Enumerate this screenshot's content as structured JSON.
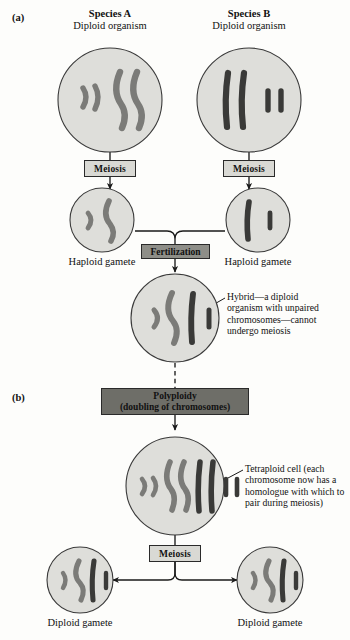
{
  "figure": {
    "type": "allopolyploidy-speciation-diagram",
    "panels": [
      {
        "id": "a",
        "label": "(a)"
      },
      {
        "id": "b",
        "label": "(b)"
      }
    ],
    "colors": {
      "cell_fill": "#dededa",
      "cell_stroke": "#3a3a3a",
      "chromosome_species_a": "#7b7b78",
      "chromosome_species_b": "#3a3a38",
      "meiosis_box": "#d9d9d4",
      "fertilization_box": "#8e8e88",
      "polyploidy_box": "#6e6e68",
      "background": "#fdfdfb"
    }
  },
  "headers": {
    "species_a": {
      "name": "Species A",
      "subtitle": "Diploid organism"
    },
    "species_b": {
      "name": "Species B",
      "subtitle": "Diploid organism"
    }
  },
  "process_boxes": {
    "meiosis_left": "Meiosis",
    "meiosis_right": "Meiosis",
    "fertilization": "Fertilization",
    "polyploidy_line1": "Polyploidy",
    "polyploidy_line2": "(doubling of chromosomes)",
    "meiosis_bottom": "Meiosis"
  },
  "captions": {
    "haploid_gamete_left": "Haploid gamete",
    "haploid_gamete_right": "Haploid gamete",
    "diploid_gamete_left": "Diploid gamete",
    "diploid_gamete_right": "Diploid gamete"
  },
  "annotations": {
    "hybrid": "Hybrid—a diploid organism with unpaired chromosomes—cannot undergo meiosis",
    "tetraploid": "Tetraploid cell (each chromosome now has a homologue with which to pair during meiosis)"
  },
  "cells": [
    {
      "id": "species-a-parent",
      "caption": "Species A diploid organism",
      "chromosome_count": 4,
      "chromosomes": [
        {
          "type": "short-curved",
          "species": "A"
        },
        {
          "type": "short-curved",
          "species": "A"
        },
        {
          "type": "long-curved",
          "species": "A"
        },
        {
          "type": "long-curved",
          "species": "A"
        }
      ]
    },
    {
      "id": "species-b-parent",
      "caption": "Species B diploid organism",
      "chromosome_count": 4,
      "chromosomes": [
        {
          "type": "long-straight",
          "species": "B"
        },
        {
          "type": "long-straight",
          "species": "B"
        },
        {
          "type": "short-straight",
          "species": "B"
        },
        {
          "type": "short-straight",
          "species": "B"
        }
      ]
    },
    {
      "id": "haploid-gamete-a",
      "caption": "Haploid gamete",
      "chromosome_count": 2,
      "chromosomes": [
        {
          "type": "short-curved",
          "species": "A"
        },
        {
          "type": "long-curved",
          "species": "A"
        }
      ]
    },
    {
      "id": "haploid-gamete-b",
      "caption": "Haploid gamete",
      "chromosome_count": 2,
      "chromosomes": [
        {
          "type": "long-straight",
          "species": "B"
        },
        {
          "type": "short-straight",
          "species": "B"
        }
      ]
    },
    {
      "id": "hybrid-cell",
      "caption": "Hybrid diploid organism",
      "chromosome_count": 4,
      "chromosomes": [
        {
          "type": "short-curved",
          "species": "A"
        },
        {
          "type": "long-curved",
          "species": "A"
        },
        {
          "type": "long-straight",
          "species": "B"
        },
        {
          "type": "short-straight",
          "species": "B"
        }
      ]
    },
    {
      "id": "tetraploid-cell",
      "caption": "Tetraploid cell",
      "chromosome_count": 8,
      "chromosomes": [
        {
          "type": "short-curved",
          "species": "A"
        },
        {
          "type": "short-curved",
          "species": "A"
        },
        {
          "type": "long-curved",
          "species": "A"
        },
        {
          "type": "long-curved",
          "species": "A"
        },
        {
          "type": "long-straight",
          "species": "B"
        },
        {
          "type": "long-straight",
          "species": "B"
        },
        {
          "type": "short-straight",
          "species": "B"
        },
        {
          "type": "short-straight",
          "species": "B"
        }
      ]
    },
    {
      "id": "diploid-gamete-left",
      "caption": "Diploid gamete",
      "chromosome_count": 4,
      "chromosomes": [
        {
          "type": "short-curved",
          "species": "A"
        },
        {
          "type": "long-curved",
          "species": "A"
        },
        {
          "type": "long-straight",
          "species": "B"
        },
        {
          "type": "short-straight",
          "species": "B"
        }
      ]
    },
    {
      "id": "diploid-gamete-right",
      "caption": "Diploid gamete",
      "chromosome_count": 4,
      "chromosomes": [
        {
          "type": "short-curved",
          "species": "A"
        },
        {
          "type": "long-curved",
          "species": "A"
        },
        {
          "type": "long-straight",
          "species": "B"
        },
        {
          "type": "short-straight",
          "species": "B"
        }
      ]
    }
  ]
}
